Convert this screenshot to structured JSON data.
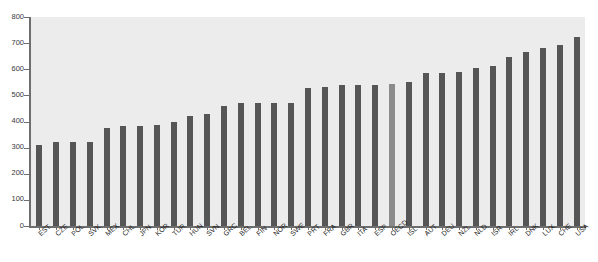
{
  "chart_data": {
    "type": "bar",
    "title": "",
    "xlabel": "",
    "ylabel": "",
    "ylim": [
      0,
      800
    ],
    "yticks": [
      0,
      100,
      200,
      300,
      400,
      500,
      600,
      700,
      800
    ],
    "grid": false,
    "legend": "none",
    "bar_color": "#565656",
    "highlight_color": "#8b8b8b",
    "highlight_category": "OECD",
    "plot_background": "#ececed",
    "categories": [
      "EST",
      "CZE",
      "POL",
      "SVK",
      "MEX",
      "CHL",
      "JPN",
      "KOR",
      "TUR",
      "HUN",
      "SVN",
      "GRC",
      "BEL",
      "FIN",
      "NOR",
      "SWE",
      "PRT",
      "FRA",
      "GBR",
      "ITA",
      "ESP",
      "OECD",
      "ISL",
      "AUT",
      "DEU",
      "NZL",
      "NLD",
      "ISR",
      "IRL",
      "DNK",
      "LUX",
      "CHE",
      "USA"
    ],
    "values": [
      310,
      323,
      323,
      323,
      375,
      383,
      383,
      385,
      398,
      420,
      430,
      460,
      470,
      470,
      470,
      470,
      528,
      533,
      538,
      538,
      538,
      545,
      553,
      585,
      585,
      590,
      605,
      612,
      648,
      668,
      680,
      692,
      722
    ],
    "series": [
      {
        "name": "Value",
        "values": [
          310,
          323,
          323,
          323,
          375,
          383,
          383,
          385,
          398,
          420,
          430,
          460,
          470,
          470,
          470,
          470,
          528,
          533,
          538,
          538,
          538,
          545,
          553,
          585,
          585,
          590,
          605,
          612,
          648,
          668,
          680,
          692,
          722
        ]
      }
    ]
  }
}
